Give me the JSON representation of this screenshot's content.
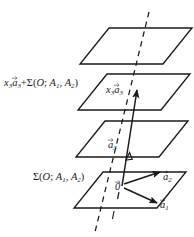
{
  "figure": {
    "background_color": "#ffffff",
    "stroke_color": "#1a1a1a",
    "labels": {
      "plane_translated": {
        "x3": "x",
        "x3_sub": "3",
        "a3": "a",
        "a3_sub": "3",
        "plus": "+",
        "sigma": "Σ(",
        "O": "O",
        "semicolon": "; ",
        "A1": "A",
        "A1_sub": "1",
        "comma": ", ",
        "A2": "A",
        "A2_sub": "2",
        "close": ")",
        "full_text": "x₃a⃗₃+Σ(O; A₁, A₂)"
      },
      "plane_base": {
        "sigma": "Σ(",
        "O": "O",
        "semicolon": "; ",
        "A1": "A",
        "A1_sub": "1",
        "comma": ", ",
        "A2": "A",
        "A2_sub": "2",
        "close": ")",
        "full_text": "Σ(O; A₁, A₂)"
      },
      "vector_x3a3": {
        "x": "x",
        "x_sub": "3",
        "a": "a",
        "a_sub": "3",
        "full_text": "x₃a⃗₃"
      },
      "vector_a3": {
        "a": "a",
        "a_sub": "3",
        "full_text": "a⃗₃"
      },
      "vector_zero": {
        "symbol": "0",
        "full_text": "0⃗"
      },
      "vector_a2": {
        "a": "a",
        "a_sub": "2",
        "full_text": "a⃗₂"
      },
      "vector_a1": {
        "a": "a",
        "a_sub": "1",
        "full_text": "a⃗₁"
      }
    },
    "planes": [
      {
        "name": "plane-top",
        "index": 1
      },
      {
        "name": "plane-translated",
        "index": 2
      },
      {
        "name": "plane-intermediate",
        "index": 3
      },
      {
        "name": "plane-base",
        "index": 4
      }
    ],
    "elements": {
      "dashed_line": "vertical dashed axis through all planes",
      "solid_axis": "solid vector from origin upward through planes",
      "arrow_a1": "arrow from origin to lower right",
      "arrow_a2": "arrow from origin to upper right",
      "tick_marks": "short dash segments below origin"
    }
  }
}
